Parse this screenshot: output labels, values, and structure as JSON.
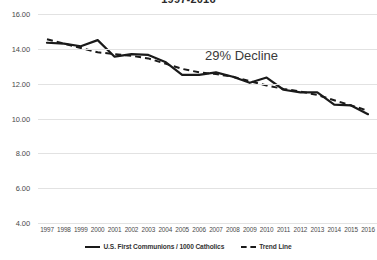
{
  "chart_data": {
    "type": "line",
    "title": "1997-2016",
    "xlabel": "",
    "ylabel": "",
    "ylim": [
      4.0,
      16.0
    ],
    "ytick_step": 2.0,
    "ytick_labels": [
      "16.00",
      "14.00",
      "12.00",
      "10.00",
      "8.00",
      "6.00",
      "4.00"
    ],
    "ytick_values": [
      16.0,
      14.0,
      12.0,
      10.0,
      8.0,
      6.0,
      4.0
    ],
    "grid": true,
    "legend_position": "bottom",
    "categories": [
      "1997",
      "1998",
      "1999",
      "2000",
      "2001",
      "2002",
      "2003",
      "2004",
      "2005",
      "2006",
      "2007",
      "2008",
      "2009",
      "2010",
      "2011",
      "2012",
      "2013",
      "2014",
      "2015",
      "2016"
    ],
    "series": [
      {
        "name": "U.S. First Communions / 1000 Catholics",
        "style": "solid",
        "color": "#1a1a1a",
        "values": [
          14.35,
          14.3,
          14.15,
          14.5,
          13.55,
          13.7,
          13.65,
          13.25,
          12.5,
          12.5,
          12.65,
          12.4,
          12.05,
          12.35,
          11.65,
          11.5,
          11.5,
          10.8,
          10.75,
          10.25
        ]
      },
      {
        "name": "Trend Line",
        "style": "dashed",
        "color": "#1a1a1a",
        "values": [
          14.55,
          14.3,
          14.05,
          13.8,
          13.7,
          13.6,
          13.45,
          13.15,
          12.85,
          12.65,
          12.55,
          12.4,
          12.15,
          11.9,
          11.7,
          11.55,
          11.35,
          11.05,
          10.75,
          10.45
        ]
      }
    ],
    "annotations": [
      {
        "text": "29% Decline",
        "x": 2009,
        "y": 13.4
      }
    ],
    "legend": [
      {
        "label": "U.S. First Communions / 1000 Catholics",
        "style": "solid"
      },
      {
        "label": "Trend Line",
        "style": "dashed"
      }
    ]
  }
}
